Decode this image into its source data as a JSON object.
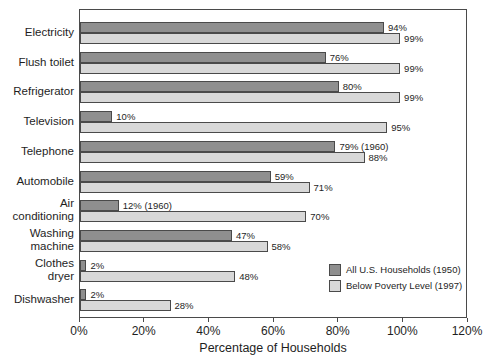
{
  "colors": {
    "bar_1950": "#8f8f8f",
    "bar_1997": "#d8d8d8",
    "outline": "#4a4a4a",
    "background": "#ffffff",
    "text": "#1e1e1e"
  },
  "chart_data": {
    "type": "bar",
    "orientation": "horizontal",
    "title": "",
    "xlabel": "Percentage of Households",
    "ylabel": "",
    "xlim": [
      0,
      120
    ],
    "xticks": [
      0,
      20,
      40,
      60,
      80,
      100,
      120
    ],
    "xtick_labels": [
      "0%",
      "20%",
      "40%",
      "60%",
      "80%",
      "100%",
      "120%"
    ],
    "grid": false,
    "legend_position": "inside-bottom-right",
    "categories": [
      "Electricity",
      "Flush toilet",
      "Refrigerator",
      "Television",
      "Telephone",
      "Automobile",
      "Air\nconditioning",
      "Washing\nmachine",
      "Clothes\ndryer",
      "Dishwasher"
    ],
    "series": [
      {
        "name": "All U.S. Households (1950)",
        "color": "#8f8f8f",
        "values": [
          94,
          76,
          80,
          10,
          79,
          59,
          12,
          47,
          2,
          2
        ],
        "labels": [
          "94%",
          "76%",
          "80%",
          "10%",
          "79% (1960)",
          "59%",
          "12% (1960)",
          "47%",
          "2%",
          "2%"
        ]
      },
      {
        "name": "Below Poverty Level (1997)",
        "color": "#d8d8d8",
        "values": [
          99,
          99,
          99,
          95,
          88,
          71,
          70,
          58,
          48,
          28
        ],
        "labels": [
          "99%",
          "99%",
          "99%",
          "95%",
          "88%",
          "71%",
          "70%",
          "58%",
          "48%",
          "28%"
        ]
      }
    ]
  }
}
